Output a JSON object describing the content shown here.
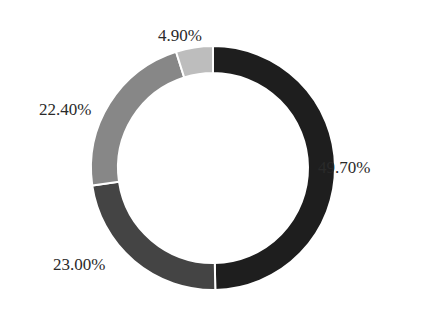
{
  "chart_data": {
    "type": "pie",
    "variant": "donut",
    "title": "",
    "legend": "none",
    "series": [
      {
        "name": "Slice 1",
        "value": 49.7,
        "label": "49.70%",
        "color": "#1e1e1e"
      },
      {
        "name": "Slice 2",
        "value": 23.0,
        "label": "23.00%",
        "color": "#444444"
      },
      {
        "name": "Slice 3",
        "value": 22.4,
        "label": "22.40%",
        "color": "#878787"
      },
      {
        "name": "Slice 4",
        "value": 4.9,
        "label": "4.90%",
        "color": "#bdbdbd"
      }
    ],
    "start_angle": "12 o'clock",
    "direction": "clockwise"
  },
  "labels": {
    "slice1": "49.70%",
    "slice2": "23.00%",
    "slice3": "22.40%",
    "slice4": "4.90%"
  }
}
